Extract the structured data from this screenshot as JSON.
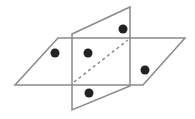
{
  "diagram": {
    "colors": {
      "line": "#8a8a8a",
      "point": "#222222",
      "background": "#ffffff"
    },
    "horizontal_plane": {
      "points": "58,38 185,38 143,85 15,85"
    },
    "vertical_plane": {
      "points": "72,34 130,7 130,86 72,110"
    },
    "intersection_line": {
      "x1": 74,
      "y1": 82,
      "x2": 128,
      "y2": 40,
      "style": "dashed"
    },
    "points": [
      {
        "cx": 55,
        "cy": 53,
        "r": 4.5
      },
      {
        "cx": 88,
        "cy": 53,
        "r": 4.5
      },
      {
        "cx": 123,
        "cy": 29,
        "r": 4.5
      },
      {
        "cx": 145,
        "cy": 70,
        "r": 4.5
      },
      {
        "cx": 89,
        "cy": 93,
        "r": 4.5
      }
    ]
  }
}
